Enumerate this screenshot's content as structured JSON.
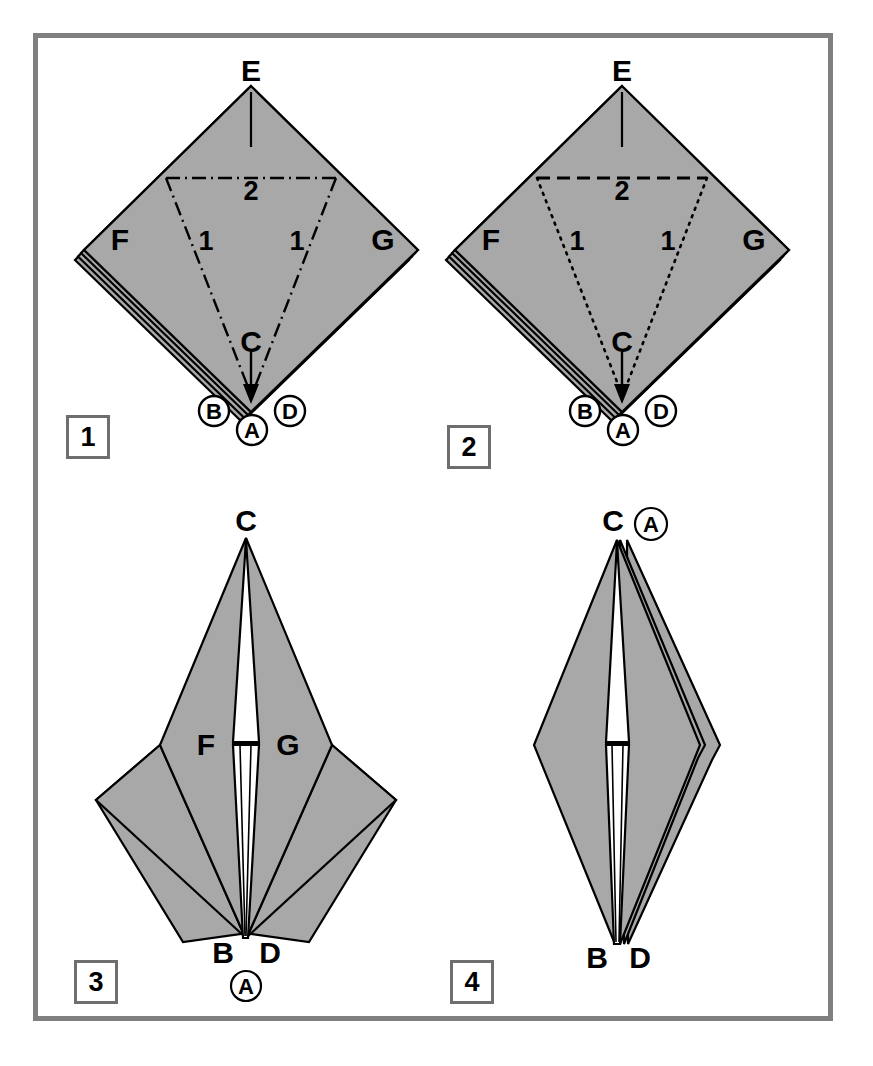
{
  "page": {
    "width": 873,
    "height": 1066,
    "background_color": "#ffffff",
    "frame_color": "#808080",
    "paper_fill_color": "#a8a8a8",
    "line_color": "#000000"
  },
  "steps": [
    {
      "number": "1",
      "box_label": "1",
      "description": "Preliminary base, point E up. Mountain-fold (dash-dot) creases marked 1 and 2.",
      "crease_style": "dash-dot",
      "points": [
        {
          "id": "E",
          "label": "E",
          "circled": false
        },
        {
          "id": "F",
          "label": "F",
          "circled": false
        },
        {
          "id": "G",
          "label": "G",
          "circled": false
        },
        {
          "id": "C",
          "label": "C",
          "circled": false
        },
        {
          "id": "B",
          "label": "B",
          "circled": true
        },
        {
          "id": "A",
          "label": "A",
          "circled": true
        },
        {
          "id": "D",
          "label": "D",
          "circled": true
        }
      ],
      "crease_labels": [
        {
          "label": "2",
          "kind": "horizontal"
        },
        {
          "label": "1",
          "kind": "diagonal-left"
        },
        {
          "label": "1",
          "kind": "diagonal-right"
        }
      ]
    },
    {
      "number": "2",
      "box_label": "2",
      "description": "Same base shown with valley (dashed) crease 2 and hidden (dotted) creases 1.",
      "crease_style": "dashed-and-dotted",
      "points": [
        {
          "id": "E",
          "label": "E",
          "circled": false
        },
        {
          "id": "F",
          "label": "F",
          "circled": false
        },
        {
          "id": "G",
          "label": "G",
          "circled": false
        },
        {
          "id": "C",
          "label": "C",
          "circled": false
        },
        {
          "id": "B",
          "label": "B",
          "circled": true
        },
        {
          "id": "A",
          "label": "A",
          "circled": true
        },
        {
          "id": "D",
          "label": "D",
          "circled": true
        }
      ],
      "crease_labels": [
        {
          "label": "2",
          "kind": "horizontal"
        },
        {
          "label": "1",
          "kind": "diagonal-left"
        },
        {
          "label": "1",
          "kind": "diagonal-right"
        }
      ]
    },
    {
      "number": "3",
      "box_label": "3",
      "description": "Result after folding: kite shape with point C at top and B, D at bottom.",
      "crease_style": "none",
      "points": [
        {
          "id": "C",
          "label": "C",
          "circled": false
        },
        {
          "id": "F",
          "label": "F",
          "circled": false
        },
        {
          "id": "G",
          "label": "G",
          "circled": false
        },
        {
          "id": "B",
          "label": "B",
          "circled": false
        },
        {
          "id": "D",
          "label": "D",
          "circled": false
        },
        {
          "id": "A",
          "label": "A",
          "circled": true
        }
      ],
      "crease_labels": []
    },
    {
      "number": "4",
      "box_label": "4",
      "description": "Narrowed diamond form with C and A at top and B, D at bottom.",
      "crease_style": "none",
      "points": [
        {
          "id": "C",
          "label": "C",
          "circled": false
        },
        {
          "id": "A",
          "label": "A",
          "circled": true
        },
        {
          "id": "B",
          "label": "B",
          "circled": false
        },
        {
          "id": "D",
          "label": "D",
          "circled": false
        }
      ],
      "crease_labels": []
    }
  ]
}
